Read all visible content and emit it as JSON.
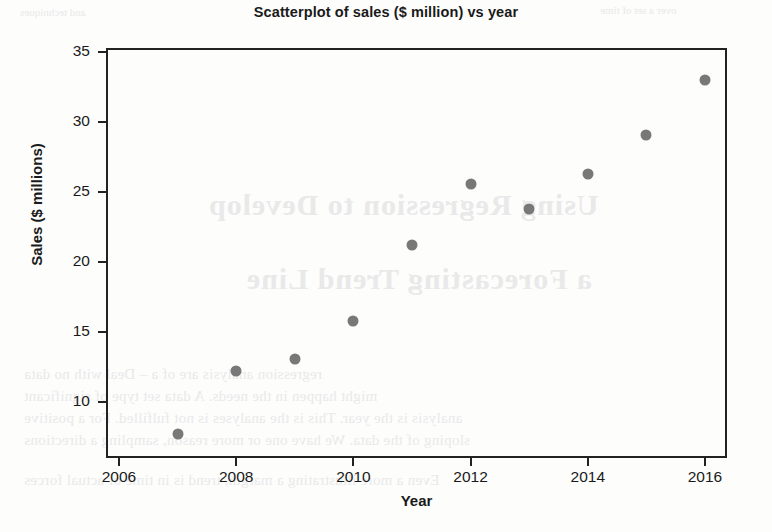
{
  "chart_data": {
    "type": "scatter",
    "title": "Scatterplot of sales ($ million) vs year",
    "xlabel": "Year",
    "ylabel": "Sales ($ millions)",
    "xlim": [
      2006,
      2016.4
    ],
    "ylim": [
      7.0,
      35.6
    ],
    "grid": false,
    "legend": null,
    "marker_color": "#787878",
    "x": [
      2007,
      2008,
      2009,
      2010,
      2011,
      2012,
      2013,
      2014,
      2015,
      2016
    ],
    "y": [
      7.7,
      12.2,
      13.1,
      15.8,
      21.2,
      25.6,
      23.8,
      26.3,
      29.1,
      33.0
    ],
    "points": [
      {
        "year": 2007,
        "sales": 7.7
      },
      {
        "year": 2008,
        "sales": 12.2
      },
      {
        "year": 2009,
        "sales": 13.1
      },
      {
        "year": 2010,
        "sales": 15.8
      },
      {
        "year": 2011,
        "sales": 21.2
      },
      {
        "year": 2012,
        "sales": 25.6
      },
      {
        "year": 2013,
        "sales": 23.8
      },
      {
        "year": 2014,
        "sales": 26.3
      },
      {
        "year": 2015,
        "sales": 29.1
      },
      {
        "year": 2016,
        "sales": 33.0
      }
    ],
    "xticks": [
      2006,
      2008,
      2010,
      2012,
      2014,
      2016
    ],
    "xticklabels": [
      "2006",
      "2008",
      "2010",
      "2012",
      "2014",
      "2016"
    ],
    "yticks": [
      10,
      15,
      20,
      25,
      30,
      35
    ],
    "yticklabels": [
      "10",
      "15",
      "20",
      "25",
      "30",
      "35"
    ]
  },
  "page_bleed": {
    "heading_line1": "Using Regression to Develop",
    "heading_line2": "a Forecasting Trend Line",
    "top_line": "and techniques",
    "top_right": "over a set of time",
    "body_line1": "regression analysis are of a – Deal with no data",
    "body_line2": "might happen in the needs. A data set type of significant",
    "body_line3": "analysis is the year. This is the analyses is not fulfilled. For a positive",
    "body_line4": "sloping of the data. We have one or more reason, sampling a directions",
    "body_line5": "Even a more illustrating a margin, trend is in time of actual forces"
  }
}
